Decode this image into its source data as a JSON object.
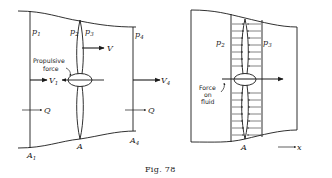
{
  "figure": {
    "caption_prefix": "Fig.",
    "caption_number": "78"
  },
  "left_diagram": {
    "labels": {
      "p1": "p",
      "p1_sub": "1",
      "p2": "p",
      "p2_sub": "2",
      "p3": "p",
      "p3_sub": "3",
      "p4": "p",
      "p4_sub": "4",
      "v": "V",
      "v1": "V",
      "v1_sub": "1",
      "v4": "V",
      "v4_sub": "4",
      "q_left": "Q",
      "q_right": "Q",
      "a": "A",
      "a1": "A",
      "a1_sub": "1",
      "a4": "A",
      "a4_sub": "4",
      "propulsive_force_line1": "Propulsive",
      "propulsive_force_line2": "force"
    }
  },
  "right_diagram": {
    "labels": {
      "p2": "p",
      "p2_sub": "2",
      "p3": "p",
      "p3_sub": "3",
      "a": "A",
      "x_axis": "x",
      "force_line1": "Force",
      "force_line2": "on",
      "force_line3": "fluid"
    }
  },
  "colors": {
    "ink": "#1a1a1a",
    "background": "#ffffff"
  }
}
